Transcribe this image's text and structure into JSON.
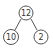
{
  "diagram": {
    "type": "number-bond-tree",
    "nodes": [
      {
        "id": "root",
        "label": "12",
        "cx": 26,
        "cy": 13,
        "r": 7
      },
      {
        "id": "left",
        "label": "10",
        "cx": 11,
        "cy": 37,
        "r": 7.5
      },
      {
        "id": "right",
        "label": "2",
        "cx": 41,
        "cy": 37,
        "r": 7
      }
    ],
    "edges": [
      {
        "from": "root",
        "to": "left"
      },
      {
        "from": "root",
        "to": "right"
      }
    ],
    "colors": {
      "stroke": "#555555",
      "text": "#333333",
      "background": "#ffffff"
    }
  }
}
